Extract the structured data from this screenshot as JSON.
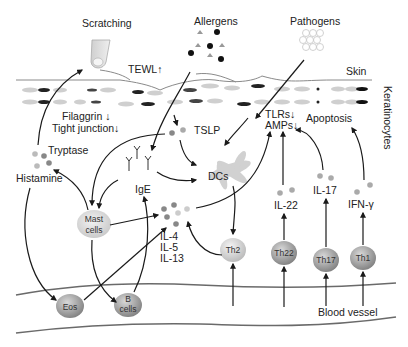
{
  "diagram": {
    "type": "atopic dermatitis pathogenesis schematic",
    "layers": {
      "skin": "Skin",
      "keratinocytes": "Keratinocytes",
      "blood_vessel": "Blood vessel"
    },
    "triggers": {
      "scratching": "Scratching",
      "allergens": "Allergens",
      "pathogens": "Pathogens"
    },
    "barrier": {
      "tewl": "TEWL↑",
      "filaggrin": "Filaggrin ↓",
      "tight_junction": "Tight junction↓"
    },
    "mediators": {
      "tslp": "TSLP",
      "tryptase": "Tryptase",
      "histamine": "Histamine",
      "ige": "IgE",
      "il4": "IL-4",
      "il5": "IL-5",
      "il13": "IL-13",
      "il22": "IL-22",
      "il17": "IL-17",
      "ifng": "IFN-γ"
    },
    "effects": {
      "tlrs": "TLRs↓",
      "amps": "AMPs↓",
      "apoptosis": "Apoptosis"
    },
    "cells": {
      "dcs": "DCs",
      "mast_line1": "Mast",
      "mast_line2": "cells",
      "eos": "Eos",
      "b_line1": "B",
      "b_line2": "cells",
      "th2": "Th2",
      "th22": "Th22",
      "th17": "Th17",
      "th1": "Th1"
    },
    "colors": {
      "arrow": "#1a1a1a",
      "cell_dark": "#8c8c8c",
      "cell_light": "#d6d6d6",
      "vessel": "#6a6a6a"
    }
  }
}
